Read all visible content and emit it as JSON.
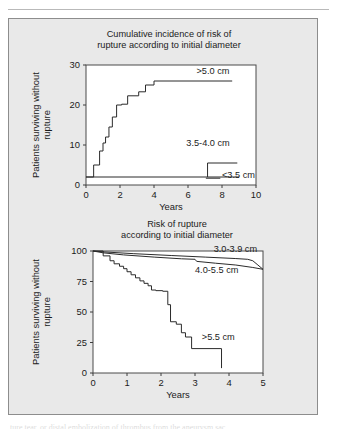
{
  "figure": {
    "background_color": "#e9e9e9",
    "panel_border_color": "#8d8d8d",
    "caption_fragment": "ture tear, or distal embolization of thrombus from the aneurysm sac"
  },
  "chart_data": [
    {
      "id": "cumulative-incidence",
      "type": "line",
      "title_line1": "Cumulative incidence of risk of",
      "title_line2": "rupture according to initial diameter",
      "xlabel": "Years",
      "ylabel_line1": "Patients surviving without",
      "ylabel_line2": "rupture",
      "xlim": [
        0,
        10
      ],
      "ylim": [
        0,
        30
      ],
      "xticks": [
        0,
        2,
        4,
        6,
        8,
        10
      ],
      "yticks": [
        0,
        10,
        20,
        30
      ],
      "xtick_labels": [
        "0",
        "2",
        "4",
        "6",
        "8",
        "10"
      ],
      "ytick_labels": [
        "0",
        "10",
        "20",
        "30"
      ],
      "grid": false,
      "legend_position": "inline-annotations",
      "series": [
        {
          "name": ">5.0 cm",
          "label": ">5.0 cm",
          "label_x": 6.5,
          "label_y": 27.8,
          "step": "post",
          "x": [
            0.0,
            0.45,
            0.45,
            0.8,
            0.8,
            1.0,
            1.0,
            1.15,
            1.15,
            1.35,
            1.35,
            1.55,
            1.55,
            1.8,
            1.8,
            2.1,
            2.1,
            2.45,
            2.45,
            3.1,
            3.1,
            3.5,
            3.5,
            4.0,
            4.0,
            8.6
          ],
          "y": [
            2.0,
            2.0,
            5.0,
            5.0,
            8.5,
            8.5,
            10.5,
            10.5,
            12.0,
            12.0,
            14.5,
            14.5,
            17.0,
            17.0,
            20.0,
            20.0,
            20.2,
            20.2,
            22.3,
            22.3,
            23.3,
            23.3,
            25.0,
            25.0,
            26.0,
            26.0
          ]
        },
        {
          "name": "3.5-4.0 cm",
          "label": "3.5-4.0 cm",
          "label_x": 5.9,
          "label_y": 9.8,
          "step": "post",
          "x": [
            7.15,
            7.15,
            8.9
          ],
          "y": [
            2.0,
            5.5,
            5.5
          ]
        },
        {
          "name": "<3.5 cm",
          "label": "<3.5 cm",
          "label_x": 8.0,
          "label_y": 1.7,
          "step": "post",
          "x": [
            0.0,
            9.0
          ],
          "y": [
            2.0,
            2.0
          ]
        }
      ]
    },
    {
      "id": "risk-of-rupture",
      "type": "line",
      "title_line1": "Risk of rupture",
      "title_line2": "according to initial diameter",
      "xlabel": "Years",
      "ylabel_line1": "Patients surviving without",
      "ylabel_line2": "rupture",
      "xlim": [
        0,
        5
      ],
      "ylim": [
        0,
        100
      ],
      "xticks": [
        0,
        1,
        2,
        3,
        4,
        5
      ],
      "yticks": [
        0,
        25,
        50,
        75,
        100
      ],
      "xtick_labels": [
        "0",
        "1",
        "2",
        "3",
        "4",
        "5"
      ],
      "ytick_labels": [
        "0",
        "25",
        "50",
        "75",
        "100"
      ],
      "grid": false,
      "legend_position": "inline-annotations",
      "series": [
        {
          "name": "3.0-3.9 cm",
          "label": "3.0-3.9 cm",
          "label_x": 3.55,
          "label_y": 99.0,
          "step": "post",
          "x": [
            0.0,
            0.35,
            1.2,
            2.3,
            3.3,
            4.2,
            4.55,
            4.7,
            4.85,
            5.0
          ],
          "y": [
            100.0,
            99.2,
            97.8,
            96.3,
            95.0,
            93.8,
            93.2,
            92.0,
            88.5,
            85.0
          ]
        },
        {
          "name": "4.0-5.5 cm",
          "label": "4.0-5.5 cm",
          "label_x": 3.0,
          "label_y": 82.0,
          "step": "post",
          "x": [
            0.0,
            0.3,
            0.9,
            1.8,
            2.6,
            3.0,
            3.05,
            3.6,
            4.2,
            4.7,
            5.0
          ],
          "y": [
            100.0,
            98.5,
            96.8,
            95.0,
            93.6,
            93.2,
            91.5,
            90.0,
            88.5,
            86.5,
            85.0
          ]
        },
        {
          "name": ">5.5 cm",
          "label": ">5.5 cm",
          "label_x": 3.2,
          "label_y": 27.0,
          "step": "post",
          "x": [
            0.0,
            0.3,
            0.3,
            0.5,
            0.5,
            0.62,
            0.62,
            0.78,
            0.78,
            0.9,
            0.9,
            1.0,
            1.0,
            1.12,
            1.12,
            1.25,
            1.25,
            1.38,
            1.38,
            1.5,
            1.5,
            1.62,
            1.62,
            1.72,
            1.72,
            1.85,
            1.85,
            2.05,
            2.05,
            2.2,
            2.2,
            2.28,
            2.28,
            2.45,
            2.45,
            2.6,
            2.6,
            2.72,
            2.72,
            2.9,
            2.9,
            3.78,
            3.78
          ],
          "y": [
            100.0,
            100.0,
            96.0,
            96.0,
            92.0,
            92.0,
            89.5,
            89.5,
            87.5,
            87.5,
            85.5,
            85.5,
            83.0,
            83.0,
            80.5,
            80.5,
            78.0,
            78.0,
            75.5,
            75.5,
            73.5,
            73.5,
            71.5,
            71.5,
            68.0,
            68.0,
            67.5,
            67.5,
            67.0,
            67.0,
            56.0,
            56.0,
            42.0,
            42.0,
            40.0,
            40.0,
            33.0,
            33.0,
            29.5,
            29.5,
            20.0,
            20.0,
            4.0
          ]
        }
      ]
    }
  ]
}
